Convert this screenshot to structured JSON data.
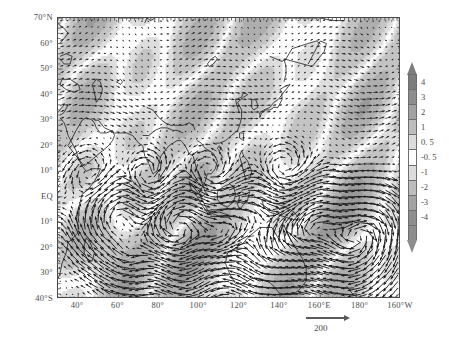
{
  "chart_data": {
    "type": "vector_field_map",
    "title": "",
    "xlabel": "",
    "ylabel": "",
    "projection": "cylindrical-equidistant",
    "grid": false,
    "xlim": [
      30,
      200
    ],
    "ylim": [
      -40,
      70
    ],
    "x_tick_values": [
      40,
      60,
      80,
      100,
      120,
      140,
      160,
      180,
      200
    ],
    "x_tick_labels": [
      "40°",
      "60°",
      "80°",
      "100°",
      "120°",
      "140°",
      "160°E",
      "180°",
      "160°W"
    ],
    "y_tick_values": [
      70,
      60,
      50,
      40,
      30,
      20,
      10,
      0,
      -10,
      -20,
      -30,
      -40
    ],
    "y_tick_labels": [
      "70°N",
      "60°",
      "50°",
      "40°",
      "30°",
      "20°",
      "10°",
      "EQ",
      "10°",
      "20°",
      "30°",
      "40°S"
    ],
    "colorbar": {
      "orientation": "vertical",
      "position": "right",
      "extend": "both",
      "tick_labels": [
        "4",
        "3",
        "2",
        "1",
        "0. 5",
        "-0. 5",
        "-1",
        "-2",
        "-3",
        "-4"
      ],
      "levels": [
        4,
        3,
        2,
        1,
        0.5,
        -0.5,
        -1,
        -2,
        -3,
        -4
      ],
      "colormap": "grayscale",
      "segment_colors": [
        "#7d7d7d",
        "#8e8e8e",
        "#a3a3a3",
        "#bdbdbd",
        "#dcdcdc",
        "#ffffff",
        "#dcdcdc",
        "#bdbdbd",
        "#a3a3a3",
        "#8e8e8e",
        "#8d8d8d"
      ]
    },
    "vector_key": {
      "label": "200",
      "magnitude": 200
    },
    "series": [
      {
        "name": "shaded-field",
        "render": "grayscale contour shading"
      },
      {
        "name": "wind-vectors",
        "render": "quiver arrows"
      },
      {
        "name": "coastlines",
        "render": "black outline"
      }
    ]
  },
  "axes": {
    "y_labels": [
      "70°N",
      "60°",
      "50°",
      "40°",
      "30°",
      "20°",
      "10°",
      "EQ",
      "10°",
      "20°",
      "30°",
      "40°S"
    ],
    "x_labels": [
      "40°",
      "60°",
      "80°",
      "100°",
      "120°",
      "140°",
      "160°E",
      "180°",
      "160°W"
    ]
  },
  "colorbar": {
    "labels": [
      "4",
      "3",
      "2",
      "1",
      "0. 5",
      "-0. 5",
      "-1",
      "-2",
      "-3",
      "-4"
    ]
  },
  "vector_key": {
    "label": "200"
  },
  "colors": {
    "frame": "#4a4a4a",
    "text": "#4a4a4a",
    "coastline": "#1a1a1a",
    "vector": "#1f1f1f",
    "background": "#ffffff"
  }
}
